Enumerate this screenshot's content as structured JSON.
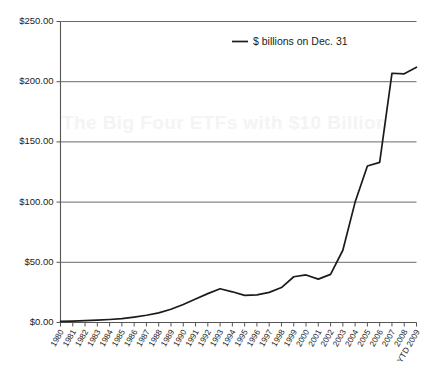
{
  "chart_data": {
    "type": "line",
    "title": "",
    "xlabel": "",
    "ylabel": "",
    "ylim": [
      0,
      250
    ],
    "ytick_step": 50,
    "grid": true,
    "legend_position": "top-center",
    "legend": [
      "$ billions on Dec. 31"
    ],
    "series_name": "$ billions on Dec. 31",
    "line_color": "#1b1b1b",
    "ytick_labels": [
      "$0.00",
      "$50.00",
      "$100.00",
      "$150.00",
      "$200.00",
      "$250.00"
    ],
    "ytick_values": [
      0,
      50,
      100,
      150,
      200,
      250
    ],
    "categories": [
      "1980",
      "1981",
      "1982",
      "1983",
      "1984",
      "1985",
      "1986",
      "1987",
      "1988",
      "1989",
      "1990",
      "1991",
      "1992",
      "1993",
      "1994",
      "1995",
      "1996",
      "1997",
      "1998",
      "1999",
      "2000",
      "2001",
      "2002",
      "2003",
      "2004",
      "2005",
      "2006",
      "2007",
      "2008",
      "YTD 2009"
    ],
    "values": [
      1.0,
      1.2,
      1.5,
      2.0,
      2.5,
      3.2,
      4.5,
      6.0,
      8.0,
      11.0,
      15.0,
      19.5,
      24.0,
      28.0,
      25.5,
      22.5,
      23.0,
      25.0,
      29.0,
      38.0,
      39.5,
      36.0,
      40.0,
      60.0,
      100.0,
      130.0,
      133.0,
      207.0,
      206.5,
      212.0
    ]
  },
  "watermark": {
    "text": "The Big Four ETFs with $10 Billion"
  }
}
